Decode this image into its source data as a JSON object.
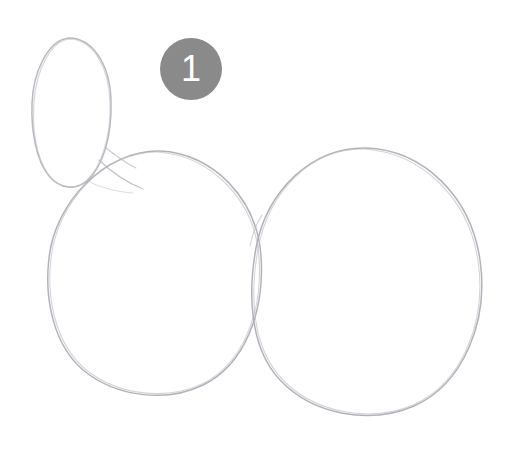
{
  "canvas": {
    "width": 512,
    "height": 450,
    "background_color": "#ffffff",
    "description": "Hand-drawn pencil sketch of overlapping circles with a numbered step marker"
  },
  "style": {
    "pencil_stroke_color": "#b4b4bc",
    "pencil_stroke_color_dark": "#9a9aa4",
    "badge_fill_color": "#8a8a8a",
    "badge_text_color": "#ffffff"
  },
  "annotations": {
    "badges": [
      {
        "id": "step-1",
        "label": "1",
        "shape": "circle",
        "center_x": 191,
        "center_y": 69,
        "diameter": 62,
        "fill": "#8a8a8a",
        "text_color": "#ffffff"
      }
    ]
  },
  "shapes": [
    {
      "name": "small-ellipse",
      "type": "ellipse",
      "center_x": 71,
      "center_y": 112,
      "radius_x": 40,
      "radius_y": 74,
      "stroke": "#b4b4bc"
    },
    {
      "name": "left-circle",
      "type": "circle",
      "center_x": 155,
      "center_y": 271,
      "radius_x": 107,
      "radius_y": 120,
      "stroke": "#b0b0b8"
    },
    {
      "name": "right-circle",
      "type": "circle",
      "center_x": 368,
      "center_y": 281,
      "radius_x": 113,
      "radius_y": 133,
      "stroke": "#b0b0b8"
    }
  ]
}
